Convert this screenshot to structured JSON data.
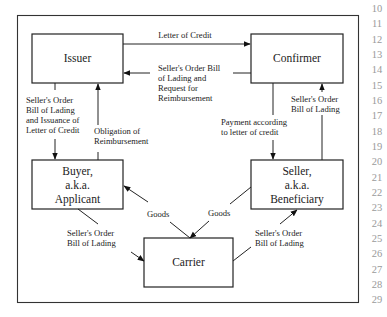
{
  "diagram": {
    "nodes": [
      {
        "id": "issuer",
        "lines": [
          "Issuer"
        ]
      },
      {
        "id": "confirmer",
        "lines": [
          "Confirmer"
        ]
      },
      {
        "id": "buyer",
        "lines": [
          "Buyer,",
          "a.k.a.",
          "Applicant"
        ]
      },
      {
        "id": "seller",
        "lines": [
          "Seller,",
          "a.k.a.",
          "Beneficiary"
        ]
      },
      {
        "id": "carrier",
        "lines": [
          "Carrier"
        ]
      }
    ],
    "edges": [
      {
        "id": "issuer-to-confirmer",
        "from": "Issuer",
        "to": "Confirmer",
        "lines": [
          "Letter of Credit"
        ]
      },
      {
        "id": "confirmer-to-issuer",
        "from": "Confirmer",
        "to": "Issuer",
        "lines": [
          "Seller's Order Bill",
          "of Lading and",
          "Request for",
          "Reimbursement"
        ]
      },
      {
        "id": "issuer-to-buyer",
        "from": "Issuer",
        "to": "Buyer",
        "lines": [
          "Seller's Order",
          "Bill of Lading",
          "and Issuance of",
          "Letter of Credit"
        ]
      },
      {
        "id": "buyer-to-issuer",
        "from": "Buyer",
        "to": "Issuer",
        "lines": [
          "Obligation of",
          "Reimbursement"
        ]
      },
      {
        "id": "confirmer-to-seller",
        "from": "Confirmer",
        "to": "Seller",
        "lines": [
          "Payment according",
          "to letter of credit"
        ]
      },
      {
        "id": "seller-to-confirmer",
        "from": "Seller",
        "to": "Confirmer",
        "lines": [
          "Seller's Order",
          "Bill of Lading"
        ]
      },
      {
        "id": "carrier-to-buyer",
        "from": "Carrier",
        "to": "Buyer",
        "lines": [
          "Goods"
        ]
      },
      {
        "id": "seller-to-carrier",
        "from": "Seller",
        "to": "Carrier",
        "lines": [
          "Goods"
        ]
      },
      {
        "id": "buyer-to-carrier",
        "from": "Buyer",
        "to": "Carrier",
        "lines": [
          "Seller's Order",
          "Bill of Lading"
        ]
      },
      {
        "id": "carrier-to-seller",
        "from": "Carrier",
        "to": "Seller",
        "lines": [
          "Seller's Order",
          "Bill of Lading"
        ]
      }
    ]
  },
  "line_numbers": [
    "10",
    "11",
    "12",
    "13",
    "14",
    "15",
    "16",
    "17",
    "18",
    "19",
    "20",
    "21",
    "22",
    "23",
    "24",
    "25",
    "26",
    "27",
    "28",
    "29"
  ],
  "colors": {
    "line": "#222222",
    "line_numbers": "#9a9a9a",
    "background": "#ffffff"
  }
}
